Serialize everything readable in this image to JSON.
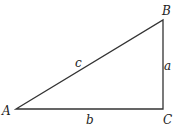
{
  "diagram": {
    "type": "right-triangle",
    "vertices": [
      {
        "id": "A",
        "label": "A",
        "x": 16,
        "y": 109
      },
      {
        "id": "B",
        "label": "B",
        "x": 163,
        "y": 20
      },
      {
        "id": "C",
        "label": "C",
        "x": 163,
        "y": 109
      }
    ],
    "sides": [
      {
        "id": "a",
        "label": "a",
        "from": "B",
        "to": "C"
      },
      {
        "id": "b",
        "label": "b",
        "from": "A",
        "to": "C"
      },
      {
        "id": "c",
        "label": "c",
        "from": "A",
        "to": "B"
      }
    ],
    "right_angle_at": "C",
    "stroke_color": "#333333"
  }
}
